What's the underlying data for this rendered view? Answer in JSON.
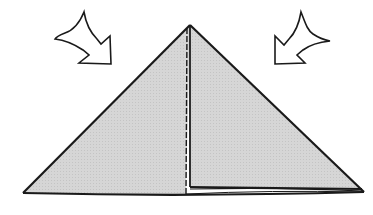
{
  "diagram": {
    "type": "origami-fold-step",
    "shape": "triangle",
    "fill_color": "#d4d4d4",
    "stroke_color": "#1a1a1a",
    "background": "#ffffff",
    "arrows": [
      {
        "name": "fold-arrow-left",
        "direction": "down-right"
      },
      {
        "name": "fold-arrow-right",
        "direction": "down-left"
      }
    ],
    "creases": [
      {
        "name": "center-crease",
        "style": "dashed-vertical"
      }
    ]
  }
}
